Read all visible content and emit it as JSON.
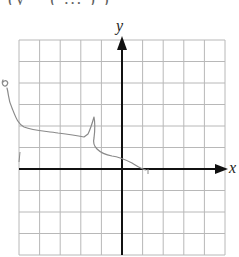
{
  "header": {
    "clipped_text": "(y  =        ( ...   )  )"
  },
  "graph": {
    "x_axis_label": "x",
    "y_axis_label": "y",
    "grid": {
      "columns": 10,
      "rows": 10,
      "left": 19,
      "top": 40,
      "right": 225,
      "bottom": 255,
      "origin_column": 5,
      "origin_row_from_top": 6,
      "line_color": "#b8b8b8",
      "axis_color": "#111111"
    },
    "pencil_color": "#8a8a8a",
    "sketch_path": "M3,80 C1,84 4,88 7,85 C9,82 6,79 3,82 M7,88 C9,95 8,100 12,108 C16,118 18,124 24,127 C34,131 46,131 58,133 C66,134 74,135 84,137 L88,134 C90,130 92,124 94,117 C95,122 95,130 94,138 C93,142 94,146 97,149 C101,153 106,155 112,156 C120,157 126,160 132,163 C137,166 141,169 146,170",
    "stray_marks": [
      "M20,152 L19,162",
      "M148,169 L148,174"
    ]
  },
  "chart_data": {
    "type": "line",
    "title": "",
    "xlabel": "x",
    "ylabel": "y",
    "grid": true,
    "xlim": [
      -5,
      5
    ],
    "ylim": [
      -4,
      6
    ],
    "series": [
      {
        "name": "hand-sketched curve",
        "x": [
          -6.0,
          -5.3,
          -4.8,
          -3.3,
          -2.0,
          -1.5,
          -1.3,
          -1.4,
          -1.2,
          -0.5,
          0.5,
          1.2
        ],
        "y": [
          4.0,
          2.8,
          2.0,
          1.7,
          1.5,
          2.4,
          1.4,
          1.0,
          0.7,
          0.6,
          0.3,
          0.0
        ]
      }
    ]
  }
}
